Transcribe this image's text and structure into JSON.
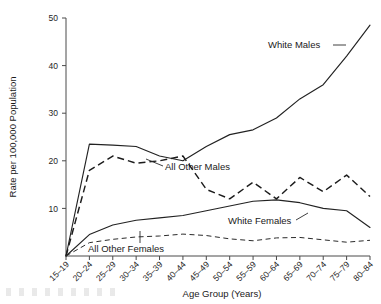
{
  "chart_data": {
    "type": "line",
    "title": "",
    "xlabel": "Age Group (Years)",
    "ylabel": "Rate per 100,000 Population",
    "categories": [
      "15-19",
      "20-24",
      "25-29",
      "30-34",
      "35-39",
      "40-44",
      "45-49",
      "50-54",
      "55-59",
      "60-64",
      "65-69",
      "70-74",
      "75-79",
      "80-84"
    ],
    "xticklabels": [
      "15–19",
      "20–24",
      "25–29",
      "30–34",
      "35–39",
      "40–44",
      "45–49",
      "50–54",
      "55–59",
      "60–64",
      "65–69",
      "70–74",
      "75–79",
      "80–84"
    ],
    "ylim": [
      0,
      50
    ],
    "yticks": [
      10,
      20,
      30,
      40,
      50
    ],
    "yticklabels": [
      "10",
      "20",
      "30",
      "40",
      "50"
    ],
    "grid": false,
    "legend_position": "inline-annotations",
    "series": [
      {
        "name": "White Males",
        "style": "solid",
        "values": [
          0,
          23.5,
          23.3,
          23.0,
          21.0,
          20.0,
          23.0,
          25.5,
          26.5,
          29.0,
          33.0,
          36.0,
          42.0,
          48.5
        ]
      },
      {
        "name": "All Other Males",
        "style": "dashed",
        "values": [
          0,
          18.0,
          21.0,
          19.5,
          20.0,
          21.0,
          14.0,
          12.0,
          15.5,
          12.0,
          16.5,
          13.5,
          17.0,
          12.5
        ]
      },
      {
        "name": "White Females",
        "style": "solid",
        "values": [
          0,
          4.5,
          6.5,
          7.5,
          8.0,
          8.5,
          9.5,
          10.5,
          11.5,
          11.8,
          11.2,
          10.0,
          9.5,
          6.0
        ]
      },
      {
        "name": "All Other Females",
        "style": "dashed",
        "values": [
          0,
          2.8,
          3.5,
          4.0,
          4.2,
          4.6,
          4.3,
          3.6,
          3.2,
          3.8,
          3.9,
          3.4,
          2.9,
          3.3
        ]
      }
    ],
    "annotations": [
      {
        "label": "White Males",
        "target_series": "White Males"
      },
      {
        "label": "All Other Males",
        "target_series": "All Other Males"
      },
      {
        "label": "White Females",
        "target_series": "White Females"
      },
      {
        "label": "All Other Females",
        "target_series": "All Other Females"
      }
    ]
  }
}
